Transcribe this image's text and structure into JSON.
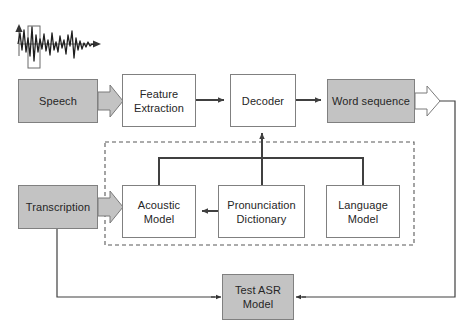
{
  "diagram": {
    "type": "flowchart",
    "colors": {
      "node_fill_gray": "#c3c3c3",
      "node_fill_white": "#ffffff",
      "node_stroke": "#808080",
      "connector": "#404040",
      "dashed_group_stroke": "#595959",
      "text": "#262626",
      "background": "#ffffff"
    },
    "waveform": {
      "name": "speech-waveform",
      "has_vertical_axis_arrow": true,
      "has_horizontal_axis_arrow": true,
      "has_frame_window": true
    },
    "nodes": [
      {
        "id": "speech",
        "label_lines": [
          "Speech"
        ],
        "fill": "gray",
        "x": 18,
        "y": 79,
        "w": 80,
        "h": 44
      },
      {
        "id": "feature",
        "label_lines": [
          "Feature",
          "Extraction"
        ],
        "fill": "white",
        "x": 122,
        "y": 74,
        "w": 74,
        "h": 53
      },
      {
        "id": "decoder",
        "label_lines": [
          "Decoder"
        ],
        "fill": "white",
        "x": 230,
        "y": 74,
        "w": 66,
        "h": 53
      },
      {
        "id": "word_sequence",
        "label_lines": [
          "Word sequence"
        ],
        "fill": "gray",
        "x": 327,
        "y": 79,
        "w": 88,
        "h": 44
      },
      {
        "id": "transcription",
        "label_lines": [
          "Transcription"
        ],
        "fill": "gray",
        "x": 18,
        "y": 185,
        "w": 80,
        "h": 44
      },
      {
        "id": "acoustic",
        "label_lines": [
          "Acoustic",
          "Model"
        ],
        "fill": "white",
        "x": 122,
        "y": 185,
        "w": 74,
        "h": 53
      },
      {
        "id": "pronunciation",
        "label_lines": [
          "Pronunciation",
          "Dictionary"
        ],
        "fill": "white",
        "x": 218,
        "y": 185,
        "w": 87,
        "h": 53
      },
      {
        "id": "language",
        "label_lines": [
          "Language",
          "Model"
        ],
        "fill": "white",
        "x": 326,
        "y": 185,
        "w": 74,
        "h": 53
      },
      {
        "id": "test_asr",
        "label_lines": [
          "Test ASR",
          "Model"
        ],
        "fill": "gray",
        "x": 222,
        "y": 274,
        "w": 72,
        "h": 46
      }
    ],
    "group_box": {
      "name": "knowledge-sources-group",
      "style": "dashed",
      "x": 105,
      "y": 142,
      "w": 309,
      "h": 103
    },
    "connectors": [
      {
        "id": "speech-to-feature",
        "style": "block-arrow",
        "from": "speech",
        "to": "feature"
      },
      {
        "id": "feature-to-decoder",
        "style": "thin-arrow",
        "from": "feature",
        "to": "decoder"
      },
      {
        "id": "decoder-to-word-sequence",
        "style": "thin-arrow",
        "from": "decoder",
        "to": "word_sequence"
      },
      {
        "id": "word-sequence-output",
        "style": "block-arrow",
        "from": "word_sequence",
        "to": "output"
      },
      {
        "id": "transcription-to-acoustic",
        "style": "block-arrow",
        "from": "transcription",
        "to": "acoustic"
      },
      {
        "id": "pronunciation-to-acoustic",
        "style": "thin-arrow",
        "from": "pronunciation",
        "to": "acoustic"
      },
      {
        "id": "models-bus-to-decoder",
        "style": "thin-arrow",
        "from": "models-bus",
        "to": "decoder"
      },
      {
        "id": "word-sequence-to-test-asr",
        "style": "thin-arrow",
        "from": "word_sequence",
        "to": "test_asr"
      },
      {
        "id": "transcription-to-test-asr",
        "style": "thin-arrow",
        "from": "transcription",
        "to": "test_asr"
      }
    ]
  }
}
